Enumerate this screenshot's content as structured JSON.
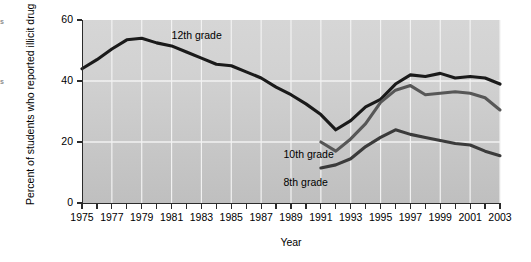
{
  "figure": {
    "edge_fragments": [
      "s",
      "",
      "",
      "s"
    ]
  },
  "axes": {
    "y_title": "Percent of students who reported illicit drug use in the last 12 months",
    "x_title": "Year",
    "y_ticks": [
      0,
      20,
      40,
      60
    ],
    "y_tick_labels": [
      "0",
      "20",
      "40",
      "60"
    ],
    "x_ticks": [
      1975,
      1976,
      1977,
      1978,
      1979,
      1980,
      1981,
      1982,
      1983,
      1984,
      1985,
      1986,
      1987,
      1988,
      1989,
      1990,
      1991,
      1992,
      1993,
      1994,
      1995,
      1996,
      1997,
      1998,
      1999,
      2000,
      2001,
      2002,
      2003
    ],
    "x_tick_labels": [
      "1975",
      "1977",
      "1979",
      "1981",
      "1983",
      "1985",
      "1987",
      "1989",
      "1991",
      "1993",
      "1995",
      "1997",
      "1999",
      "2001",
      "2003"
    ],
    "x_labeled_years": [
      1975,
      1977,
      1979,
      1981,
      1983,
      1985,
      1987,
      1989,
      1991,
      1993,
      1995,
      1997,
      1999,
      2001,
      2003
    ]
  },
  "series_labels": {
    "grade12": "12th grade",
    "grade10": "10th grade",
    "grade8": "8th grade"
  },
  "colors": {
    "grade12": "#1a1a1a",
    "grade10": "#575757",
    "grade8": "#3b3b3b",
    "plot_background_top": "#d6d6d6",
    "plot_background_bottom": "#bfbfbf",
    "gridline": "#f2f2f2",
    "axis": "#2b2b2b"
  },
  "chart_data": {
    "type": "line",
    "title": "",
    "subtitle": "",
    "xlabel": "Year",
    "ylabel": "Percent of students who reported illicit drug use in the last 12 months",
    "xlim": [
      1975,
      2003
    ],
    "ylim": [
      0,
      60
    ],
    "grid": true,
    "grid_axis": "both",
    "legend": "inline-annotations",
    "x": [
      1975,
      1976,
      1977,
      1978,
      1979,
      1980,
      1981,
      1982,
      1983,
      1984,
      1985,
      1986,
      1987,
      1988,
      1989,
      1990,
      1991,
      1992,
      1993,
      1994,
      1995,
      1996,
      1997,
      1998,
      1999,
      2000,
      2001,
      2002,
      2003
    ],
    "series": [
      {
        "name": "12th grade",
        "color": "#1a1a1a",
        "x": [
          1975,
          1976,
          1977,
          1978,
          1979,
          1980,
          1981,
          1982,
          1983,
          1984,
          1985,
          1986,
          1987,
          1988,
          1989,
          1990,
          1991,
          1992,
          1993,
          1994,
          1995,
          1996,
          1997,
          1998,
          1999,
          2000,
          2001,
          2002,
          2003
        ],
        "values": [
          44.0,
          47.0,
          50.5,
          53.5,
          54.0,
          52.5,
          51.5,
          49.5,
          47.5,
          45.5,
          45.0,
          43.0,
          41.0,
          38.0,
          35.5,
          32.5,
          29.0,
          24.0,
          27.0,
          31.5,
          34.0,
          39.0,
          42.0,
          41.5,
          42.5,
          41.0,
          41.5,
          41.0,
          39.0
        ]
      },
      {
        "name": "10th grade",
        "color": "#575757",
        "x": [
          1991,
          1992,
          1993,
          1994,
          1995,
          1996,
          1997,
          1998,
          1999,
          2000,
          2001,
          2002,
          2003
        ],
        "values": [
          20.0,
          17.0,
          21.0,
          26.0,
          33.0,
          37.0,
          38.5,
          35.5,
          36.0,
          36.5,
          36.0,
          34.5,
          30.5
        ]
      },
      {
        "name": "8th grade",
        "color": "#3b3b3b",
        "x": [
          1991,
          1992,
          1993,
          1994,
          1995,
          1996,
          1997,
          1998,
          1999,
          2000,
          2001,
          2002,
          2003
        ],
        "values": [
          11.5,
          12.5,
          14.5,
          18.5,
          21.5,
          24.0,
          22.5,
          21.5,
          20.5,
          19.5,
          19.0,
          17.0,
          15.5
        ]
      }
    ],
    "annotations": [
      {
        "text": "12th grade",
        "x": 1981,
        "y": 55
      },
      {
        "text": "10th grade",
        "x": 1988.5,
        "y": 16
      },
      {
        "text": "8th grade",
        "x": 1988.5,
        "y": 7
      }
    ]
  }
}
